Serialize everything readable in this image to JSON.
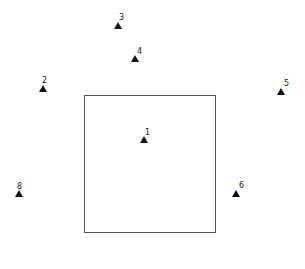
{
  "diagram": {
    "square": {
      "left": 84,
      "top": 95,
      "width": 132,
      "height": 138,
      "border_color": "#555555"
    },
    "markers": [
      {
        "label": "1",
        "x": 144,
        "y": 140,
        "lx": 145,
        "ly": 129
      },
      {
        "label": "2",
        "x": 43,
        "y": 89,
        "lx": 42,
        "ly": 77
      },
      {
        "label": "3",
        "x": 118,
        "y": 26,
        "lx": 119,
        "ly": 14
      },
      {
        "label": "4",
        "x": 135,
        "y": 59,
        "lx": 137,
        "ly": 48
      },
      {
        "label": "5",
        "x": 281,
        "y": 92,
        "lx": 284,
        "ly": 80
      },
      {
        "label": "6",
        "x": 236,
        "y": 194,
        "lx": 239,
        "ly": 182
      },
      {
        "label": "8",
        "x": 19,
        "y": 194,
        "lx": 17,
        "ly": 183
      }
    ],
    "marker_color": "#111111"
  }
}
